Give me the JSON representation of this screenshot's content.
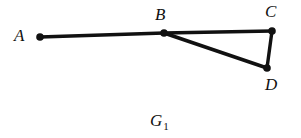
{
  "figure": {
    "caption_main": "G",
    "caption_subscript": "1",
    "caption_full": "G1",
    "background_color": "#ffffff",
    "ink_color": "#111111",
    "width": 301,
    "height": 138
  },
  "graph": {
    "type": "undirected-graph-diagram",
    "vertex_radius": 3.6,
    "edge_width": 3.4,
    "vertices": [
      {
        "id": "A",
        "label": "A",
        "x": 40,
        "y": 37
      },
      {
        "id": "B",
        "label": "B",
        "x": 164,
        "y": 33
      },
      {
        "id": "C",
        "label": "C",
        "x": 272,
        "y": 31
      },
      {
        "id": "D",
        "label": "D",
        "x": 267,
        "y": 68
      }
    ],
    "edges": [
      {
        "id": "AB",
        "from": "A",
        "to": "B"
      },
      {
        "id": "BC",
        "from": "B",
        "to": "C"
      },
      {
        "id": "BD",
        "from": "B",
        "to": "D"
      },
      {
        "id": "CD",
        "from": "C",
        "to": "D"
      }
    ],
    "labels": {
      "A": "A",
      "B": "B",
      "C": "C",
      "D": "D"
    }
  }
}
